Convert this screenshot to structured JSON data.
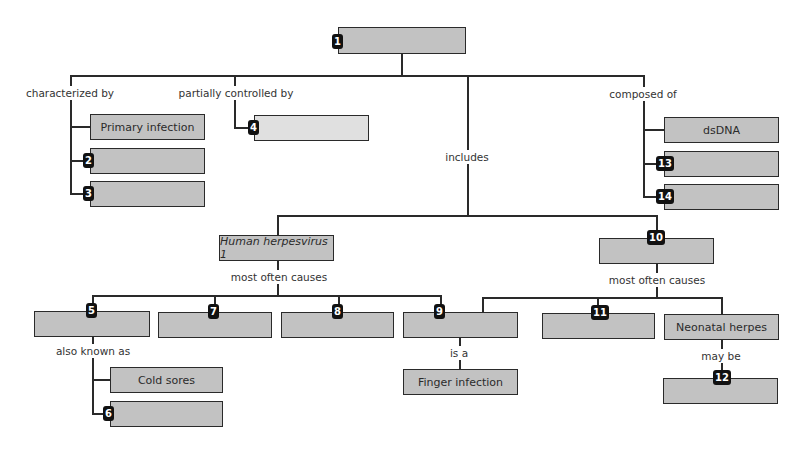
{
  "diagram": {
    "type": "concept-map",
    "colors": {
      "box_fill": "#c2c2c2",
      "box_fill_light": "#e0e0e0",
      "border": "#2a2a2a",
      "badge": "#111111"
    },
    "root": {
      "badge": "1",
      "text": ""
    },
    "links": {
      "characterized_by": "characterized by",
      "partially_controlled_by": "partially controlled by",
      "includes": "includes",
      "composed_of": "composed of",
      "most_often_causes_left": "most often causes",
      "most_often_causes_right": "most often causes",
      "also_known_as": "also known as",
      "is_a": "is a",
      "may_be": "may be"
    },
    "characterized": [
      {
        "badge": "",
        "text": "Primary infection"
      },
      {
        "badge": "2",
        "text": ""
      },
      {
        "badge": "3",
        "text": ""
      }
    ],
    "controlled": {
      "badge": "4",
      "text": ""
    },
    "composed": [
      {
        "badge": "",
        "text": "dsDNA"
      },
      {
        "badge": "13",
        "text": ""
      },
      {
        "badge": "14",
        "text": ""
      }
    ],
    "hhv1": {
      "text": "Human herpesvirus 1"
    },
    "box10": {
      "badge": "10",
      "text": ""
    },
    "hhv1_causes": [
      {
        "badge": "5",
        "text": ""
      },
      {
        "badge": "7",
        "text": ""
      },
      {
        "badge": "8",
        "text": ""
      },
      {
        "badge": "9",
        "text": ""
      }
    ],
    "box10_causes": [
      {
        "badge": "11",
        "text": ""
      },
      {
        "badge": "",
        "text": "Neonatal herpes"
      }
    ],
    "aka": [
      {
        "badge": "",
        "text": "Cold sores"
      },
      {
        "badge": "6",
        "text": ""
      }
    ],
    "is_a_target": {
      "text": "Finger infection"
    },
    "may_be_target": {
      "badge": "12",
      "text": ""
    }
  }
}
